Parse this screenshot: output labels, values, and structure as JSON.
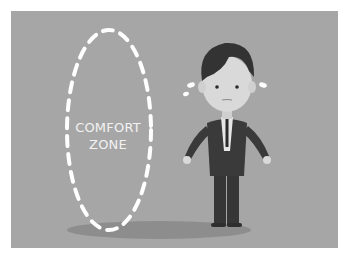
{
  "illustration": {
    "label_line1": "COMFORT",
    "label_line2": "ZONE",
    "colors": {
      "background": "#a6a6a6",
      "page": "#ffffff",
      "dashes": "#ffffff",
      "suit": "#3a3a3a",
      "hair": "#333333",
      "skin": "#d9d9d9",
      "shadow": "#8c8c8c"
    }
  }
}
